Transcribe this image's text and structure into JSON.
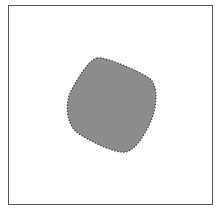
{
  "canvas": {
    "shape": "rounded-quadrilateral",
    "fill_color": "#8c8c8c",
    "stroke_color": "#444444",
    "stroke_style": "dotted"
  },
  "caption": {
    "text": ""
  }
}
